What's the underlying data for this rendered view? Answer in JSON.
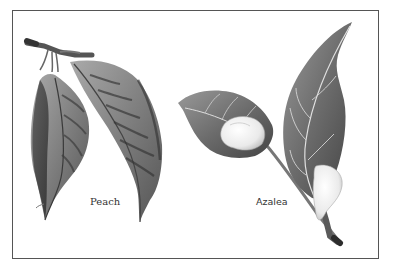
{
  "illustration": {
    "labels": {
      "left": "Peach",
      "right": "Azalea"
    },
    "colors": {
      "border": "#555555",
      "leaf_dark": "#3a3a3a",
      "leaf_mid": "#8a8a8a",
      "leaf_light": "#c8c8c8",
      "gall": "#efefef",
      "background": "#ffffff"
    }
  }
}
